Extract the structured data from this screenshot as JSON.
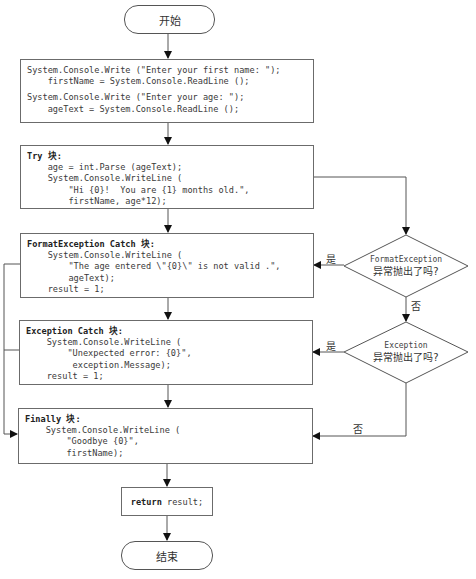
{
  "flowchart": {
    "start": {
      "label": "开始"
    },
    "end": {
      "label": "结束"
    },
    "input_block": {
      "lines": [
        "System.Console.Write (\"Enter your first name: \");",
        "    firstName = System.Console.ReadLine ();",
        "",
        "System.Console.Write (\"Enter your age: \");",
        "    ageText = System.Console.ReadLine ();"
      ]
    },
    "try_block": {
      "header": "Try 块:",
      "lines": [
        "    age = int.Parse (ageText);",
        "    System.Console.WriteLine (",
        "        \"Hi {0}!  You are {1} months old.\",",
        "        firstName, age*12);"
      ]
    },
    "format_catch_block": {
      "header": "FormatException Catch 块:",
      "lines": [
        "    System.Console.WriteLine (",
        "        \"The age entered \\\"{0}\\\" is not valid .\",",
        "        ageText);",
        "    result = 1;"
      ]
    },
    "exception_catch_block": {
      "header": "Exception Catch 块:",
      "lines": [
        "    System.Console.WriteLine (",
        "        \"Unexpected error: {0}\",",
        "         exception.Message);",
        "    result = 1;"
      ]
    },
    "finally_block": {
      "header": "Finally 块:",
      "lines": [
        "    System.Console.WriteLine (",
        "        \"Goodbye {0}\",",
        "        firstName);"
      ]
    },
    "return_block": {
      "keyword": "return",
      "rest": " result;"
    },
    "decision_format": {
      "line1": "FormatException",
      "line2": "异常抛出了吗?"
    },
    "decision_exception": {
      "line1": "Exception",
      "line2": "异常抛出了吗?"
    },
    "labels": {
      "yes1": "是",
      "no1": "否",
      "yes2": "是",
      "no2": "否"
    }
  }
}
